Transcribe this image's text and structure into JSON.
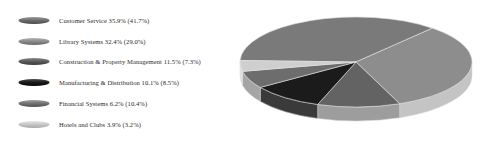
{
  "chart_data": {
    "type": "pie",
    "title": "",
    "subtitle": "",
    "xlabel": "",
    "ylabel": "",
    "grid": false,
    "legend_position": "left",
    "three_d": true,
    "value_unit": "percent",
    "note": "Each legend entry shows the current share followed by a prior/comparison share in parentheses.",
    "categories": [
      "Customer Service",
      "Library Systems",
      "Construction & Property Management",
      "Manufacturing & Distribution",
      "Financial Systems",
      "Hotels and Clubs"
    ],
    "values": [
      35.9,
      32.4,
      11.5,
      10.1,
      6.2,
      3.9
    ],
    "secondary_values": [
      41.7,
      29.0,
      7.3,
      8.5,
      10.4,
      3.2
    ],
    "colors": [
      "#6f6f6f",
      "#8c8c8c",
      "#5c5c5c",
      "#1c1c1c",
      "#747474",
      "#c9c9c9"
    ],
    "series": [
      {
        "name": "Current",
        "values": [
          35.9,
          32.4,
          11.5,
          10.1,
          6.2,
          3.9
        ]
      },
      {
        "name": "Comparison",
        "values": [
          41.7,
          29.0,
          7.3,
          8.5,
          10.4,
          3.2
        ]
      }
    ]
  },
  "legend": {
    "items": [
      {
        "name": "Customer Service",
        "value": "35.9%",
        "secondary": "(41.7%)",
        "text": "Customer Service 35.9% (41.7%)",
        "color": "#6f6f6f",
        "color_light": "#9a9a9a",
        "color_dark": "#4a4a4a"
      },
      {
        "name": "Library Systems",
        "value": "32.4%",
        "secondary": "(29.0%)",
        "text": "Library Systems 32.4% (29.0%)",
        "color": "#8c8c8c",
        "color_light": "#b4b4b4",
        "color_dark": "#6a6a6a"
      },
      {
        "name": "Construction & Property Management",
        "value": "11.5%",
        "secondary": "(7.3%)",
        "text": "Construction & Property Management 11.5% (7.3%)",
        "color": "#5c5c5c",
        "color_light": "#8b8b8b",
        "color_dark": "#3c3c3c"
      },
      {
        "name": "Manufacturing & Distribution",
        "value": "10.1%",
        "secondary": "(8.5%)",
        "text": "Manufacturing & Distribution 10.1% (8.5%)",
        "color": "#1c1c1c",
        "color_light": "#4d4d4d",
        "color_dark": "#050505"
      },
      {
        "name": "Financial Systems",
        "value": "6.2%",
        "secondary": "(10.4%)",
        "text": "Financial Systems 6.2% (10.4%)",
        "color": "#747474",
        "color_light": "#a0a0a0",
        "color_dark": "#505050"
      },
      {
        "name": "Hotels and Clubs",
        "value": "3.9%",
        "secondary": "(3.2%)",
        "text": "Hotels and Clubs 3.9% (3.2%)",
        "color": "#c9c9c9",
        "color_light": "#e6e6e6",
        "color_dark": "#a8a8a8"
      }
    ]
  },
  "pie": {
    "slices": [
      {
        "label": "Customer Service",
        "percent": 35.9,
        "top": "#7a7a7a",
        "side": "#b9b9b9"
      },
      {
        "label": "Library Systems",
        "percent": 32.4,
        "top": "#8d8d8d",
        "side": "#c4c4c4"
      },
      {
        "label": "Construction & Property Management",
        "percent": 11.5,
        "top": "#636363",
        "side": "#9d9d9d"
      },
      {
        "label": "Manufacturing & Distribution",
        "percent": 10.1,
        "top": "#1b1b1b",
        "side": "#3a3a3a"
      },
      {
        "label": "Financial Systems",
        "percent": 6.2,
        "top": "#6d6d6d",
        "side": "#a5a5a5"
      },
      {
        "label": "Hotels and Clubs",
        "percent": 3.9,
        "top": "#cfcfcf",
        "side": "#e2e2e2"
      }
    ]
  }
}
